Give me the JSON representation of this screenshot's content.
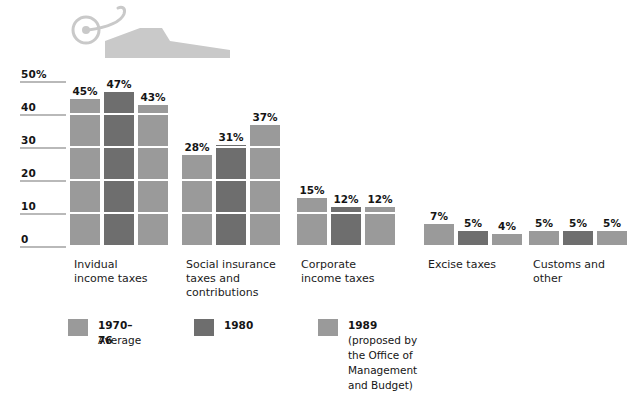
{
  "chart_data": {
    "type": "bar",
    "title": "",
    "xlabel": "",
    "ylabel": "",
    "ylim": [
      0,
      50
    ],
    "grid": true,
    "legend_position": "bottom",
    "axis_unit": "%",
    "ticks": [
      {
        "value": 50,
        "label": "50%"
      },
      {
        "value": 40,
        "label": "40"
      },
      {
        "value": 30,
        "label": "30"
      },
      {
        "value": 20,
        "label": "20"
      },
      {
        "value": 10,
        "label": "10"
      },
      {
        "value": 0,
        "label": "0"
      }
    ],
    "categories": [
      "Invidual\nincome taxes",
      "Social insurance\ntaxes and\ncontributions",
      "Corporate\nincome taxes",
      "Excise taxes",
      "Customs and\nother"
    ],
    "series": [
      {
        "name": "1970–76",
        "subname": "Average",
        "color": "#9a9a9a",
        "values": [
          45,
          28,
          15,
          7,
          5
        ],
        "labels": [
          "45%",
          "28%",
          "15%",
          "7%",
          "5%"
        ]
      },
      {
        "name": "1980",
        "subname": "",
        "color": "#6e6e6e",
        "values": [
          47,
          31,
          12,
          5,
          5
        ],
        "labels": [
          "47%",
          "31%",
          "12%",
          "5%",
          "5%"
        ]
      },
      {
        "name": "1989",
        "subname": "(proposed by the Office of\nManagement and Budget)",
        "color": "#9a9a9a",
        "values": [
          43,
          37,
          12,
          4,
          5
        ],
        "labels": [
          "43%",
          "37%",
          "12%",
          "4%",
          "5%"
        ]
      }
    ]
  },
  "decoration": {
    "icon": "wheelbarrow-icon",
    "color": "#c9c9c9"
  },
  "colors": {
    "series_light": "#9a9a9a",
    "series_dark": "#6e6e6e",
    "tick_rule": "#b9b9b9",
    "text": "#151515",
    "background": "#ffffff"
  }
}
